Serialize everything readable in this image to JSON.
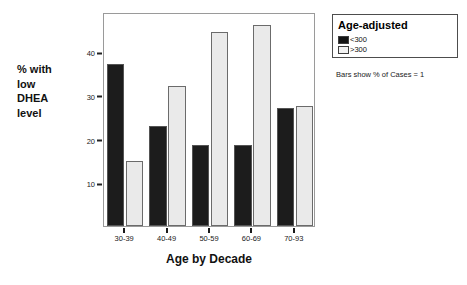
{
  "chart_data": {
    "type": "bar",
    "title": "",
    "xlabel": "Age by Decade",
    "ylabel": "% with low DHEA level",
    "ylabel_lines": [
      "% with",
      "low",
      "DHEA",
      "level"
    ],
    "categories": [
      "30-39",
      "40-49",
      "50-59",
      "60-69",
      "70-93"
    ],
    "series": [
      {
        "name": "<300",
        "color": "#1c1c1c",
        "values": [
          37,
          23,
          18.5,
          18.5,
          27
        ]
      },
      {
        "name": ">300",
        "color": "#eaeaea",
        "values": [
          15,
          32,
          44.5,
          46,
          27.5
        ]
      }
    ],
    "ylim": [
      0,
      49
    ],
    "yticks": [
      10,
      20,
      30,
      40
    ],
    "ytick_labels": [
      "10",
      "20",
      "30",
      "40"
    ],
    "grid": false,
    "legend": {
      "title": "Age-adjusted",
      "position": "top-right",
      "entries": [
        "<300",
        ">300"
      ]
    },
    "caption": "Bars show % of Cases = 1"
  },
  "legend": {
    "title": "Age-adjusted",
    "caption": "Bars show % of Cases = 1"
  },
  "axes": {
    "x_title": "Age by Decade",
    "y_title_lines": [
      "% with",
      "low",
      "DHEA",
      "level"
    ]
  }
}
